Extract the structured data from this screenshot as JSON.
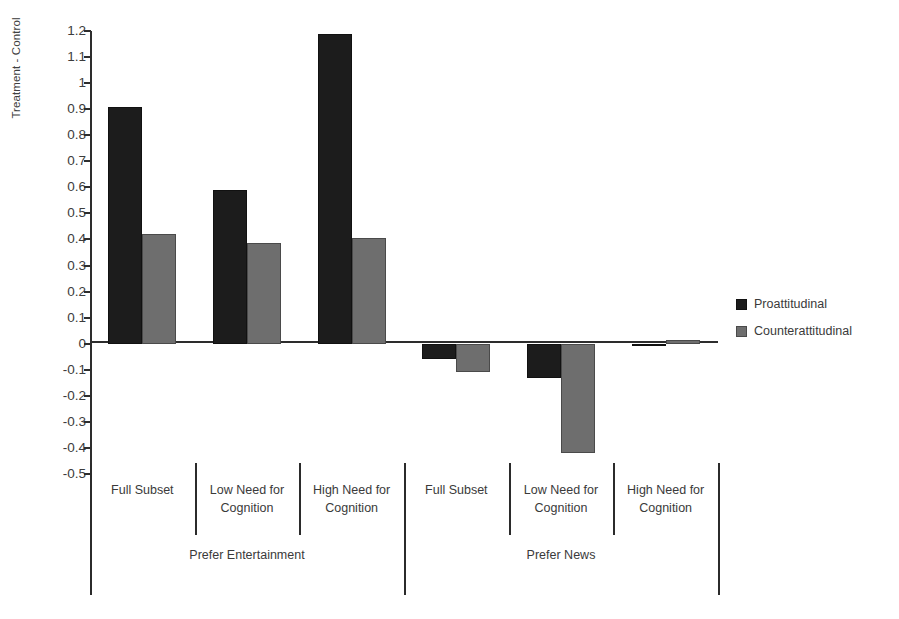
{
  "chart_data": {
    "type": "bar",
    "title": "",
    "xlabel": "",
    "ylabel": "Treatment - Control",
    "ylim": [
      -0.5,
      1.2
    ],
    "ytick_step": 0.1,
    "yticks": [
      1.2,
      1.1,
      1,
      0.9,
      0.8,
      0.7,
      0.6,
      0.5,
      0.4,
      0.3,
      0.2,
      0.1,
      0,
      -0.1,
      -0.2,
      -0.3,
      -0.4,
      -0.5
    ],
    "ytick_labels": [
      "1.2",
      "1.1",
      "1",
      "0.9",
      "0.8",
      "0.7",
      "0.6",
      "0.5",
      "0.4",
      "0.3",
      "0.2",
      "0.1",
      "0",
      "-0.1",
      "-0.2",
      "-0.3",
      "-0.4",
      "-0.5"
    ],
    "grid": false,
    "legend_position": "right",
    "categories": [
      "Full Subset",
      "Low Need for Cognition",
      "High Need for Cognition",
      "Full Subset",
      "Low Need for Cognition",
      "High Need for Cognition"
    ],
    "groups": [
      {
        "label": "Prefer Entertainment",
        "categories": [
          0,
          1,
          2
        ]
      },
      {
        "label": "Prefer News",
        "categories": [
          3,
          4,
          5
        ]
      }
    ],
    "series": [
      {
        "name": "Proattitudinal",
        "color": "#1c1c1c",
        "values": [
          0.91,
          0.59,
          1.19,
          -0.06,
          -0.13,
          -0.01
        ]
      },
      {
        "name": "Counterattitudinal",
        "color": "#6e6e6e",
        "values": [
          0.42,
          0.385,
          0.405,
          -0.11,
          -0.42,
          0.015
        ]
      }
    ]
  },
  "legend": {
    "items": [
      {
        "label": "Proattitudinal",
        "swatch": "series-pro"
      },
      {
        "label": "Counterattitudinal",
        "swatch": "series-counter"
      }
    ]
  },
  "axis": {
    "y_title": "Treatment - Control"
  }
}
